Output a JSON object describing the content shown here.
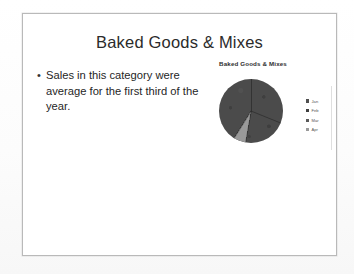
{
  "slide": {
    "title": "Baked Goods & Mixes",
    "bullets": [
      {
        "marker": "•",
        "text": "Sales in this category were average for the first third of the year."
      }
    ]
  },
  "chart_data": {
    "type": "pie",
    "title": "Baked Goods & Mixes",
    "categories": [
      "Jan",
      "Feb",
      "Mar",
      "Apr"
    ],
    "values": [
      31,
      27,
      36,
      6
    ],
    "colors": [
      "#4f4f4f",
      "#3f3f3f",
      "#5a5a5a",
      "#9a9a9a"
    ],
    "legend_position": "right",
    "grid": false,
    "xlabel": "",
    "ylabel": ""
  },
  "legend": [
    {
      "label": "Jan",
      "color": "#4f4f4f"
    },
    {
      "label": "Feb",
      "color": "#3f3f3f"
    },
    {
      "label": "Mar",
      "color": "#5a5a5a"
    },
    {
      "label": "Apr",
      "color": "#9a9a9a"
    }
  ]
}
